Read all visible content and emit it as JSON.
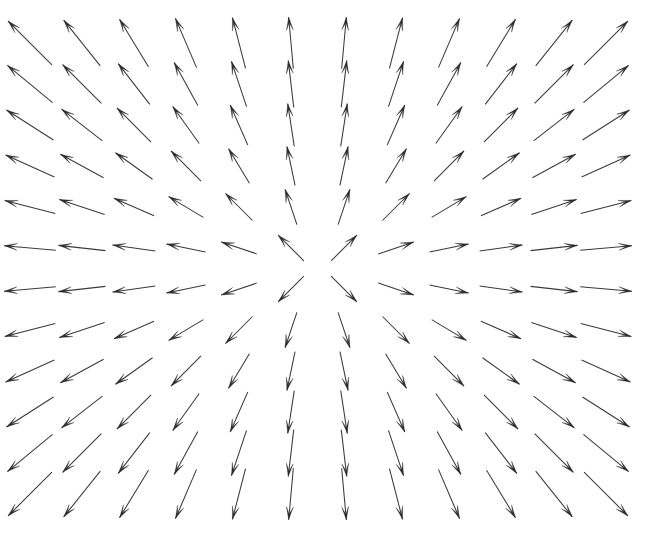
{
  "figure": {
    "title": "",
    "background_color": "#ffffff",
    "width": 648,
    "height": 540,
    "axes_visible": false,
    "ticks_visible": false,
    "legend_visible": false,
    "frame_visible": false
  },
  "style": {
    "arrow_color": "#3a3a3a",
    "arrow_head_color": "#2b2b2b",
    "line_width": 1.05,
    "head_length_px": 13,
    "head_half_width_px": 3.4,
    "head_barb_inset": 0.42
  },
  "chart_data": {
    "type": "scatter",
    "plot_kind": "quiver",
    "title": "",
    "subtitle": "",
    "xlabel": "",
    "ylabel": "",
    "grid": false,
    "legend_position": "none",
    "xlim": [
      -1.1,
      1.1
    ],
    "ylim": [
      -1.1,
      1.1
    ],
    "xticklabels": [],
    "yticklabels": [],
    "annotations": [],
    "grid_shape": [
      12,
      12
    ],
    "n_arrows": 144,
    "field_description": "radial source: vectors point outward from a central singularity, magnitude increasing with distance from center",
    "singularity_px": [
      318,
      268
    ],
    "x": [
      -1.0,
      -0.8182,
      -0.6364,
      -0.4545,
      -0.2727,
      -0.0909,
      0.0909,
      0.2727,
      0.4545,
      0.6364,
      0.8182,
      1.0
    ],
    "y": [
      1.0,
      0.8182,
      0.6364,
      0.4545,
      0.2727,
      0.0909,
      -0.0909,
      -0.2727,
      -0.4545,
      -0.6364,
      -0.8182,
      -1.0
    ],
    "u": [
      [
        -0.7071,
        -0.6247,
        -0.5193,
        -0.3939,
        -0.2508,
        -0.0905,
        0.0905,
        0.2508,
        0.3939,
        0.5193,
        0.6247,
        0.7071
      ],
      [
        -0.7713,
        -0.7071,
        -0.6116,
        -0.4804,
        -0.3162,
        -0.116,
        0.116,
        0.3162,
        0.4804,
        0.6116,
        0.7071,
        0.7713
      ],
      [
        -0.8437,
        -0.79,
        -0.7071,
        -0.5812,
        -0.4001,
        -0.1515,
        0.1515,
        0.4001,
        0.5812,
        0.7071,
        0.79,
        0.8437
      ],
      [
        -0.9104,
        -0.8771,
        -0.8137,
        -0.7071,
        -0.5145,
        -0.2041,
        0.2041,
        0.5145,
        0.7071,
        0.8137,
        0.8771,
        0.9104
      ],
      [
        -0.968,
        -0.9487,
        -0.9165,
        -0.8575,
        -0.7071,
        -0.3162,
        0.3162,
        0.7071,
        0.8575,
        0.9165,
        0.9487,
        0.968
      ],
      [
        -0.9959,
        -0.9938,
        -0.9901,
        -0.9806,
        -0.9487,
        -0.7071,
        0.7071,
        0.9487,
        0.9806,
        0.9901,
        0.9938,
        0.9959
      ],
      [
        -0.9959,
        -0.9938,
        -0.9901,
        -0.9806,
        -0.9487,
        -0.7071,
        0.7071,
        0.9487,
        0.9806,
        0.9901,
        0.9938,
        0.9959
      ],
      [
        -0.968,
        -0.9487,
        -0.9165,
        -0.8575,
        -0.7071,
        -0.3162,
        0.3162,
        0.7071,
        0.8575,
        0.9165,
        0.9487,
        0.968
      ],
      [
        -0.9104,
        -0.8771,
        -0.8137,
        -0.7071,
        -0.5145,
        -0.2041,
        0.2041,
        0.5145,
        0.7071,
        0.8137,
        0.8771,
        0.9104
      ],
      [
        -0.8437,
        -0.79,
        -0.7071,
        -0.5812,
        -0.4001,
        -0.1515,
        0.1515,
        0.4001,
        0.5812,
        0.7071,
        0.79,
        0.8437
      ],
      [
        -0.7713,
        -0.7071,
        -0.6116,
        -0.4804,
        -0.3162,
        -0.116,
        0.116,
        0.3162,
        0.4804,
        0.6116,
        0.7071,
        0.7713
      ],
      [
        -0.7071,
        -0.6247,
        -0.5193,
        -0.3939,
        -0.2508,
        -0.0905,
        0.0905,
        0.2508,
        0.3939,
        0.5193,
        0.6247,
        0.7071
      ]
    ],
    "v": [
      [
        0.7071,
        0.7809,
        0.8546,
        0.9191,
        0.9681,
        0.9959,
        0.9959,
        0.9681,
        0.9191,
        0.8546,
        0.7809,
        0.7071
      ],
      [
        0.6364,
        0.7071,
        0.7911,
        0.877,
        0.9487,
        0.9932,
        0.9932,
        0.9487,
        0.877,
        0.7911,
        0.7071,
        0.6364
      ],
      [
        0.5368,
        0.6131,
        0.7071,
        0.8138,
        0.9165,
        0.9885,
        0.9885,
        0.9165,
        0.8138,
        0.7071,
        0.6131,
        0.5368
      ],
      [
        0.4137,
        0.4803,
        0.5813,
        0.7071,
        0.8575,
        0.979,
        0.979,
        0.8575,
        0.7071,
        0.5813,
        0.4803,
        0.4137
      ],
      [
        0.2508,
        0.3162,
        0.4,
        0.5145,
        0.7071,
        0.9487,
        0.9487,
        0.7071,
        0.5145,
        0.4,
        0.3162,
        0.2508
      ],
      [
        0.0905,
        0.1114,
        0.14,
        0.1961,
        0.3162,
        0.7071,
        0.7071,
        0.3162,
        0.1961,
        0.14,
        0.1114,
        0.0905
      ],
      [
        -0.0905,
        -0.1114,
        -0.14,
        -0.1961,
        -0.3162,
        -0.7071,
        -0.7071,
        -0.3162,
        -0.1961,
        -0.14,
        -0.1114,
        -0.0905
      ],
      [
        -0.2508,
        -0.3162,
        -0.4,
        -0.5145,
        -0.7071,
        -0.9487,
        -0.9487,
        -0.7071,
        -0.5145,
        -0.4,
        -0.3162,
        -0.2508
      ],
      [
        -0.4137,
        -0.4803,
        -0.5813,
        -0.7071,
        -0.8575,
        -0.979,
        -0.979,
        -0.8575,
        -0.7071,
        -0.5813,
        -0.4803,
        -0.4137
      ],
      [
        -0.5368,
        -0.6131,
        -0.7071,
        -0.8138,
        -0.9165,
        -0.9885,
        -0.9885,
        -0.9165,
        -0.8138,
        -0.7071,
        -0.6131,
        -0.5368
      ],
      [
        -0.6364,
        -0.7071,
        -0.7911,
        -0.877,
        -0.9487,
        -0.9932,
        -0.9932,
        -0.9487,
        -0.877,
        -0.7911,
        -0.7071,
        -0.6364
      ],
      [
        -0.7071,
        -0.7809,
        -0.8546,
        -0.9191,
        -0.9681,
        -0.9959,
        -0.9959,
        -0.9681,
        -0.9191,
        -0.8546,
        -0.7809,
        -0.7071
      ]
    ],
    "magnitude": [
      [
        1.4142,
        1.3346,
        1.2694,
        1.221,
        1.1915,
        1.1817,
        1.1817,
        1.1915,
        1.221,
        1.2694,
        1.3346,
        1.4142
      ],
      [
        1.3346,
        1.2494,
        1.1776,
        1.1228,
        1.0882,
        1.076,
        1.076,
        1.0882,
        1.1228,
        1.1776,
        1.2494,
        1.3346
      ],
      [
        1.2694,
        1.1776,
        1.0992,
        1.0375,
        0.9977,
        0.9833,
        0.9833,
        0.9977,
        1.0375,
        1.0992,
        1.1776,
        1.2694
      ],
      [
        1.221,
        1.1228,
        1.0375,
        0.9686,
        0.9231,
        0.9061,
        0.9061,
        0.9231,
        0.9686,
        1.0375,
        1.1228,
        1.221
      ],
      [
        1.1915,
        1.0882,
        0.9977,
        0.9231,
        0.8712,
        0.8511,
        0.8511,
        0.8712,
        0.9231,
        0.9977,
        1.0882,
        1.1915
      ],
      [
        1.1817,
        1.076,
        0.9833,
        0.9061,
        0.8511,
        0.8286,
        0.8286,
        0.8511,
        0.9061,
        0.9833,
        1.076,
        1.1817
      ],
      [
        1.1817,
        1.076,
        0.9833,
        0.9061,
        0.8511,
        0.8286,
        0.8286,
        0.8511,
        0.9061,
        0.9833,
        1.076,
        1.1817
      ],
      [
        1.1915,
        1.0882,
        0.9977,
        0.9231,
        0.8712,
        0.8511,
        0.8511,
        0.8712,
        0.9231,
        0.9977,
        1.0882,
        1.1915
      ],
      [
        1.221,
        1.1228,
        1.0375,
        0.9686,
        0.9231,
        0.9061,
        0.9061,
        0.9231,
        0.9686,
        1.0375,
        1.1228,
        1.221
      ],
      [
        1.2694,
        1.1776,
        1.0992,
        1.0375,
        0.9977,
        0.9833,
        0.9833,
        0.9977,
        1.0375,
        1.0992,
        1.1776,
        1.2694
      ],
      [
        1.3346,
        1.2494,
        1.1776,
        1.1228,
        1.0882,
        1.076,
        1.076,
        1.0882,
        1.1228,
        1.1776,
        1.2494,
        1.3346
      ],
      [
        1.4142,
        1.3346,
        1.2694,
        1.221,
        1.1915,
        1.1817,
        1.1817,
        1.1915,
        1.221,
        1.2694,
        1.3346,
        1.4142
      ]
    ],
    "pixel_layout": {
      "col_x": [
        30,
        82,
        134,
        186,
        239,
        291,
        344,
        396,
        449,
        501,
        554,
        606
      ],
      "row_y": [
        43,
        84,
        125,
        166,
        207,
        248,
        289,
        330,
        371,
        412,
        453,
        494
      ],
      "col_spacing": 52.4,
      "row_spacing": 41.0,
      "max_shaft_length": 62
    }
  }
}
